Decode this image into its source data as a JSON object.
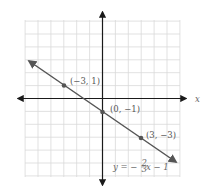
{
  "chart_data": {
    "type": "line",
    "title": "",
    "xlabel": "x",
    "ylabel": "y",
    "xlim": [
      -6,
      6
    ],
    "ylim": [
      -6,
      6
    ],
    "grid": true,
    "series": [
      {
        "name": "y = -2/3 x - 1",
        "equation": "y = −⅔x − 1",
        "slope": -0.6667,
        "intercept": -1,
        "points": [
          {
            "x": -3,
            "y": 1,
            "label": "(−3, 1)"
          },
          {
            "x": 0,
            "y": -1,
            "label": "(0, −1)"
          },
          {
            "x": 3,
            "y": -3,
            "label": "(3, −3)"
          }
        ],
        "color": "#555555"
      }
    ],
    "annotations": [
      "(−3, 1)",
      "(0, −1)",
      "(3, −3)",
      "y = −⅔x − 1"
    ]
  },
  "labels": {
    "x_axis": "x",
    "p1": "(−3, 1)",
    "p2": "(0, −1)",
    "p3": "(3, −3)",
    "eq_prefix": "y = −",
    "eq_num": "2",
    "eq_den": "3",
    "eq_suffix": "x − 1"
  },
  "colors": {
    "grid": "#d9d9d9",
    "axis": "#1a1a1a",
    "line": "#555555",
    "text": "#555555"
  }
}
